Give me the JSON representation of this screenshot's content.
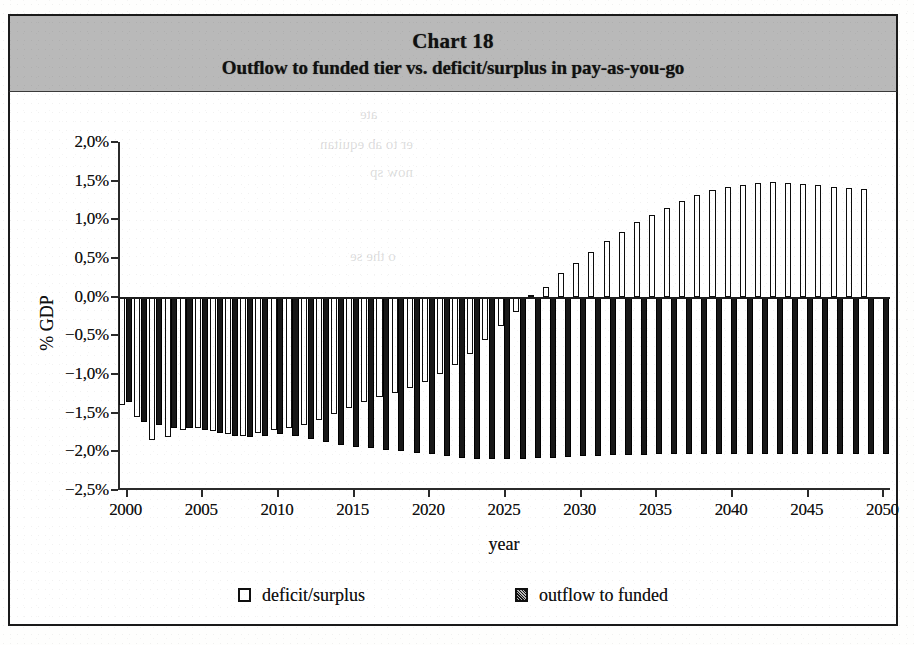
{
  "figure": {
    "chart_number_label": "Chart 18",
    "title": "Outflow to funded tier vs. deficit/surplus in pay-as-you-go"
  },
  "axes": {
    "y_axis_label": "% GDP",
    "x_axis_label": "year",
    "y_tick_labels": [
      "2,0%",
      "1,5%",
      "1,0%",
      "0,5%",
      "0,0%",
      "−0,5%",
      "−1,0%",
      "−1,5%",
      "−2,0%",
      "−2,5%"
    ],
    "x_tick_labels": [
      "2000",
      "2005",
      "2010",
      "2015",
      "2020",
      "2025",
      "2030",
      "2035",
      "2040",
      "2045",
      "2050"
    ]
  },
  "legend": {
    "items": [
      {
        "label": "deficit/surplus",
        "swatch": "hollow-square-marker"
      },
      {
        "label": "outflow to funded",
        "swatch": "filled-square-marker"
      }
    ]
  },
  "ghost_text": {
    "line1": "ate",
    "line2": "er to ab equitan",
    "line3": "now sp",
    "line4": "o the se"
  },
  "colors": {
    "title_band": "#b9b9b9",
    "frame": "#1a1a1a",
    "deficit_fill": "#ffffff",
    "deficit_edge": "#0d0d0d",
    "outflow_fill": "#181818",
    "axis": "#2b2b2b",
    "background": "#ffffff"
  },
  "chart_data": {
    "type": "bar",
    "title": "Outflow to funded tier vs. deficit/surplus in pay-as-you-go",
    "chart_number": "Chart 18",
    "xlabel": "year",
    "ylabel": "% GDP",
    "ylim": [
      -2.5,
      2.0
    ],
    "ytick_values": [
      2.0,
      1.5,
      1.0,
      0.5,
      0.0,
      -0.5,
      -1.0,
      -1.5,
      -2.0,
      -2.5
    ],
    "xlim": [
      2000,
      2050
    ],
    "xtick_values": [
      2000,
      2005,
      2010,
      2015,
      2020,
      2025,
      2030,
      2035,
      2040,
      2045,
      2050
    ],
    "grid": false,
    "legend_position": "below-axes",
    "units": "percent of GDP",
    "x": [
      2000,
      2001,
      2002,
      2003,
      2004,
      2005,
      2006,
      2007,
      2008,
      2009,
      2010,
      2011,
      2012,
      2013,
      2014,
      2015,
      2016,
      2017,
      2018,
      2019,
      2020,
      2021,
      2022,
      2023,
      2024,
      2025,
      2026,
      2027,
      2028,
      2029,
      2030,
      2031,
      2032,
      2033,
      2034,
      2035,
      2036,
      2037,
      2038,
      2039,
      2040,
      2041,
      2042,
      2043,
      2044,
      2045,
      2046,
      2047,
      2048,
      2049,
      2050
    ],
    "series": [
      {
        "name": "deficit/surplus",
        "style": "hollow",
        "values": [
          -1.4,
          -1.55,
          -1.86,
          -1.82,
          -1.72,
          -1.7,
          -1.74,
          -1.78,
          -1.8,
          -1.76,
          -1.72,
          -1.7,
          -1.66,
          -1.6,
          -1.52,
          -1.44,
          -1.36,
          -1.3,
          -1.24,
          -1.18,
          -1.1,
          -1.0,
          -0.88,
          -0.74,
          -0.56,
          -0.38,
          -0.2,
          0.02,
          0.12,
          0.3,
          0.44,
          0.58,
          0.72,
          0.84,
          0.96,
          1.06,
          1.15,
          1.24,
          1.32,
          1.38,
          1.42,
          1.45,
          1.47,
          1.48,
          1.47,
          1.46,
          1.44,
          1.42,
          1.41,
          1.39,
          0.0
        ]
      },
      {
        "name": "outflow to funded",
        "style": "filled",
        "values": [
          -1.36,
          -1.62,
          -1.66,
          -1.7,
          -1.7,
          -1.72,
          -1.76,
          -1.8,
          -1.82,
          -1.8,
          -1.78,
          -1.8,
          -1.84,
          -1.88,
          -1.92,
          -1.94,
          -1.96,
          -1.98,
          -2.0,
          -2.02,
          -2.04,
          -2.06,
          -2.08,
          -2.1,
          -2.1,
          -2.1,
          -2.1,
          -2.08,
          -2.08,
          -2.07,
          -2.06,
          -2.06,
          -2.05,
          -2.05,
          -2.05,
          -2.04,
          -2.04,
          -2.04,
          -2.04,
          -2.04,
          -2.04,
          -2.04,
          -2.04,
          -2.04,
          -2.04,
          -2.04,
          -2.04,
          -2.04,
          -2.04,
          -2.04,
          -2.04
        ]
      }
    ]
  }
}
